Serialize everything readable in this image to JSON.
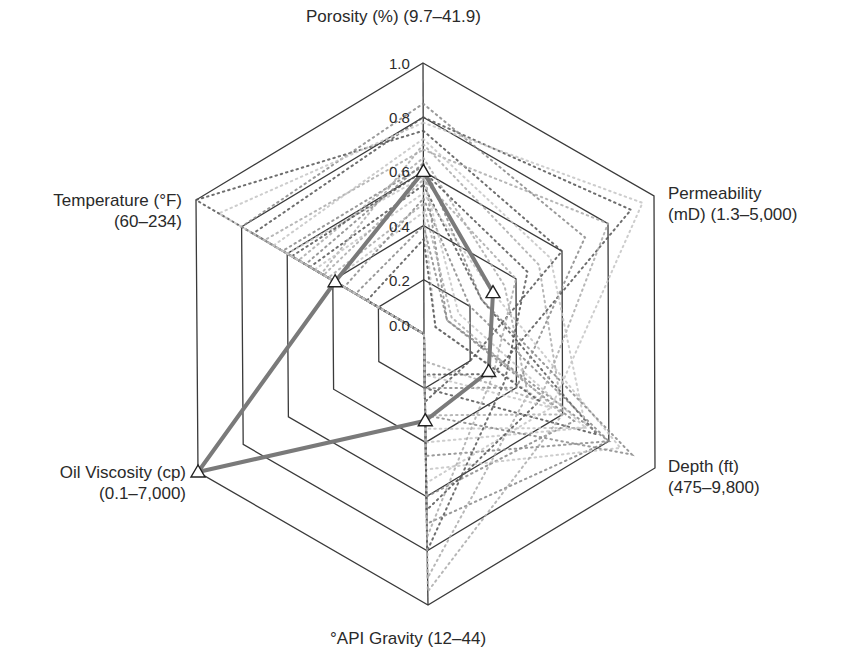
{
  "chart_data": {
    "type": "radar",
    "title": "",
    "axes": [
      {
        "name": "Porosity (%)",
        "range": "(9.7–41.9)",
        "label_lines": [
          "Porosity (%) (9.7–41.9)"
        ]
      },
      {
        "name": "Permeability (mD)",
        "range": "(1.3–5,000)",
        "label_lines": [
          "Permeability",
          "(mD) (1.3–5,000)"
        ]
      },
      {
        "name": "Depth (ft)",
        "range": "(475–9,800)",
        "label_lines": [
          "Depth (ft)",
          "(475–9,800)"
        ]
      },
      {
        "name": "°API Gravity",
        "range": "(12–44)",
        "label_lines": [
          "°API Gravity (12–44)"
        ]
      },
      {
        "name": "Oil Viscosity (cp)",
        "range": "(0.1–7,000)",
        "label_lines": [
          "Oil Viscosity (cp)",
          "(0.1–7,000)"
        ]
      },
      {
        "name": "Temperature (°F)",
        "range": "(60–234)",
        "label_lines": [
          "Temperature (°F)",
          "(60–234)"
        ]
      }
    ],
    "radial_ticks": [
      "0.0",
      "0.2",
      "0.4",
      "0.6",
      "0.8",
      "1.0"
    ],
    "rlim": [
      0,
      1
    ],
    "grid": true,
    "highlighted_series": {
      "name": "highlighted reservoir",
      "marker": "triangle",
      "color": "#7a7a7a",
      "values": [
        0.6,
        0.3,
        0.28,
        0.32,
        1.0,
        0.39
      ]
    },
    "background_series_style": "dotted gray lines (many reservoirs)",
    "background_series": [
      {
        "values": [
          0.55,
          0.25,
          0.75,
          0.2,
          0.0,
          0.5
        ]
      },
      {
        "values": [
          0.62,
          0.1,
          0.8,
          0.45,
          0.0,
          0.62
        ]
      },
      {
        "values": [
          0.7,
          0.5,
          0.6,
          0.3,
          0.0,
          0.45
        ]
      },
      {
        "values": [
          0.45,
          0.05,
          0.55,
          0.55,
          0.0,
          0.4
        ]
      },
      {
        "values": [
          0.8,
          0.9,
          0.3,
          0.15,
          0.0,
          0.75
        ]
      },
      {
        "values": [
          0.5,
          0.2,
          0.8,
          0.7,
          0.0,
          0.35
        ]
      },
      {
        "values": [
          0.65,
          0.35,
          0.45,
          0.9,
          0.0,
          0.55
        ]
      },
      {
        "values": [
          0.58,
          0.15,
          0.7,
          0.35,
          0.0,
          0.6
        ]
      },
      {
        "values": [
          0.75,
          0.6,
          0.2,
          0.25,
          0.0,
          1.0
        ]
      },
      {
        "values": [
          0.4,
          0.1,
          0.65,
          0.6,
          0.0,
          0.3
        ]
      },
      {
        "values": [
          0.68,
          0.8,
          0.5,
          0.1,
          0.0,
          0.7
        ]
      },
      {
        "values": [
          0.52,
          0.3,
          0.85,
          0.5,
          0.0,
          0.48
        ]
      },
      {
        "values": [
          0.6,
          0.45,
          0.35,
          0.8,
          0.0,
          0.58
        ]
      },
      {
        "values": [
          0.85,
          0.7,
          0.4,
          0.2,
          0.0,
          0.8
        ]
      },
      {
        "values": [
          0.48,
          0.12,
          0.6,
          0.95,
          0.0,
          0.42
        ]
      },
      {
        "values": [
          0.72,
          0.55,
          0.7,
          0.4,
          0.0,
          0.66
        ]
      },
      {
        "values": [
          0.35,
          0.05,
          0.5,
          0.65,
          0.0,
          0.25
        ]
      },
      {
        "values": [
          0.63,
          0.25,
          0.9,
          0.3,
          0.0,
          0.52
        ]
      },
      {
        "values": [
          0.57,
          0.4,
          0.3,
          0.75,
          0.0,
          0.44
        ]
      },
      {
        "values": [
          0.78,
          0.95,
          0.55,
          0.15,
          0.0,
          0.9
        ]
      }
    ]
  },
  "colors": {
    "grid": "#3a3a3a",
    "highlight": "#7a7a7a",
    "dots": [
      "#555555",
      "#888888",
      "#aaaaaa",
      "#c4c4c4"
    ]
  }
}
